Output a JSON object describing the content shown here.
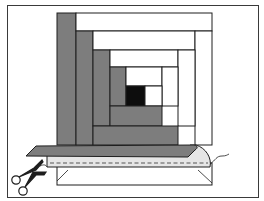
{
  "diagram": {
    "colors": {
      "background": "#ffffff",
      "frame": "#3a3a3a",
      "dark_strip": "#7d7d7d",
      "light_strip": "#ffffff",
      "center_square": "#0d0d0d",
      "lining": "#e6e6e6",
      "outline": "#1e1e1e",
      "stitch": "#555555"
    },
    "block": {
      "strips": [
        {
          "id": "dark-1",
          "tone": "dark",
          "x": 57,
          "y": 13,
          "w": 19,
          "h": 132
        },
        {
          "id": "light-1",
          "tone": "light",
          "x": 76,
          "y": 13,
          "w": 136,
          "h": 18
        },
        {
          "id": "dark-2",
          "tone": "dark",
          "x": 76,
          "y": 31,
          "w": 17,
          "h": 114
        },
        {
          "id": "light-2",
          "tone": "light",
          "x": 93,
          "y": 31,
          "w": 102,
          "h": 19
        },
        {
          "id": "light-right-1",
          "tone": "light",
          "x": 195,
          "y": 31,
          "w": 17,
          "h": 114
        },
        {
          "id": "dark-3",
          "tone": "dark",
          "x": 93,
          "y": 50,
          "w": 17,
          "h": 76
        },
        {
          "id": "light-3",
          "tone": "light",
          "x": 110,
          "y": 50,
          "w": 68,
          "h": 17
        },
        {
          "id": "light-right-2",
          "tone": "light",
          "x": 178,
          "y": 50,
          "w": 17,
          "h": 76
        },
        {
          "id": "dark-4",
          "tone": "dark",
          "x": 110,
          "y": 67,
          "w": 16,
          "h": 39
        },
        {
          "id": "light-4",
          "tone": "light",
          "x": 126,
          "y": 67,
          "w": 36,
          "h": 19
        },
        {
          "id": "light-right-3",
          "tone": "light",
          "x": 162,
          "y": 67,
          "w": 16,
          "h": 39
        },
        {
          "id": "center",
          "tone": "center",
          "x": 126,
          "y": 86,
          "w": 19,
          "h": 20
        },
        {
          "id": "light-5",
          "tone": "light",
          "x": 145,
          "y": 86,
          "w": 17,
          "h": 20
        },
        {
          "id": "dark-bottom-1",
          "tone": "dark",
          "x": 110,
          "y": 106,
          "w": 52,
          "h": 20
        },
        {
          "id": "dark-bottom-2",
          "tone": "dark",
          "x": 93,
          "y": 126,
          "w": 85,
          "h": 19
        }
      ]
    },
    "icons": [
      "scissors-icon",
      "thread-icon"
    ]
  }
}
